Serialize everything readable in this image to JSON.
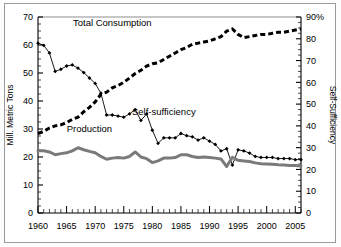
{
  "figure": {
    "background": "#ffffff",
    "frame_color": "#9a9a9a"
  },
  "chart_data": {
    "type": "line",
    "title": "",
    "xlabel": "",
    "ylabel": "Mill. Metric Tons",
    "y2label": "Self-Sufficiency",
    "xlim": [
      1960,
      2006
    ],
    "ylim": [
      0,
      70
    ],
    "y2lim": [
      0,
      90
    ],
    "grid": false,
    "legend": "inline-annotations",
    "xticks": [
      1960,
      1965,
      1970,
      1975,
      1980,
      1985,
      1990,
      1995,
      2000,
      2005
    ],
    "xticklabels": [
      "1960",
      "1965",
      "1970",
      "1975",
      "1980",
      "1985",
      "1990",
      "1995",
      "2000",
      "2005"
    ],
    "yticks": [
      0,
      10,
      20,
      30,
      40,
      50,
      60,
      70
    ],
    "yticklabels": [
      "0",
      "10",
      "20",
      "30",
      "40",
      "50",
      "60",
      "70"
    ],
    "y2ticks": [
      0,
      10,
      20,
      30,
      40,
      50,
      60,
      70,
      80,
      90
    ],
    "y2ticklabels": [
      "0",
      "10",
      "20",
      "30",
      "40",
      "50",
      "60",
      "70",
      "80",
      "90%"
    ],
    "minor_xtick_interval": 1,
    "minor_ytick_interval": 2.5,
    "x": [
      1960,
      1961,
      1962,
      1963,
      1964,
      1965,
      1966,
      1967,
      1968,
      1969,
      1970,
      1971,
      1972,
      1973,
      1974,
      1975,
      1976,
      1977,
      1978,
      1979,
      1980,
      1981,
      1982,
      1983,
      1984,
      1985,
      1986,
      1987,
      1988,
      1989,
      1990,
      1991,
      1992,
      1993,
      1994,
      1995,
      1996,
      1997,
      1998,
      1999,
      2000,
      2001,
      2002,
      2003,
      2004,
      2005,
      2006
    ],
    "series": [
      {
        "name": "Total Consumption",
        "axis": "right",
        "units": "%",
        "style": "thick-dashed",
        "color": "#000000",
        "label_x": 1973,
        "label_y": 86,
        "values": [
          36.5,
          37.5,
          39.0,
          40.0,
          40.5,
          41.5,
          43.0,
          44.0,
          46.5,
          48.5,
          51.0,
          54.5,
          55.5,
          57.5,
          58.5,
          60.0,
          62.0,
          64.0,
          65.5,
          67.5,
          68.5,
          69.0,
          70.5,
          72.0,
          73.5,
          75.0,
          76.0,
          77.5,
          78.0,
          78.5,
          79.0,
          80.0,
          81.0,
          83.5,
          84.5,
          82.0,
          80.5,
          81.0,
          81.5,
          82.0,
          82.0,
          82.5,
          83.0,
          83.0,
          83.5,
          84.0,
          84.5
        ]
      },
      {
        "name": "Self-sufficiency",
        "axis": "right",
        "units": "%",
        "style": "thin-line-diamond-markers",
        "color": "#000000",
        "label_x": 1982,
        "label_y": 45,
        "values": [
          78.0,
          77.0,
          73.5,
          65.0,
          66.0,
          67.5,
          68.0,
          66.5,
          64.5,
          62.0,
          59.5,
          55.0,
          45.0,
          45.0,
          44.5,
          44.0,
          45.5,
          47.5,
          42.5,
          45.5,
          38.0,
          32.0,
          34.5,
          34.5,
          34.5,
          36.5,
          35.5,
          35.0,
          33.5,
          34.5,
          33.0,
          31.5,
          28.5,
          29.5,
          22.0,
          29.0,
          28.5,
          27.5,
          26.0,
          25.5,
          25.5,
          25.5,
          25.0,
          25.0,
          25.0,
          24.5,
          24.5
        ]
      },
      {
        "name": "Production",
        "axis": "left",
        "units": "Mill. Metric Tons",
        "style": "thick-solid",
        "color": "#7a7a7a",
        "label_x": 1969,
        "label_y": 29,
        "values": [
          22.2,
          22.2,
          21.8,
          20.8,
          21.2,
          21.5,
          22.2,
          23.3,
          22.6,
          22.0,
          21.5,
          20.2,
          19.2,
          19.6,
          19.8,
          19.6,
          20.2,
          21.8,
          20.0,
          19.4,
          18.0,
          18.6,
          19.6,
          19.6,
          19.8,
          20.8,
          20.8,
          20.2,
          19.8,
          20.0,
          19.8,
          19.6,
          19.3,
          16.6,
          19.9,
          18.8,
          18.6,
          18.4,
          17.9,
          17.6,
          17.5,
          17.4,
          17.2,
          17.1,
          17.0,
          17.0,
          16.8
        ]
      }
    ]
  },
  "annotations": {
    "total_consumption": "Total Consumption",
    "self_sufficiency": "Self-sufficiency",
    "production": "Production"
  }
}
